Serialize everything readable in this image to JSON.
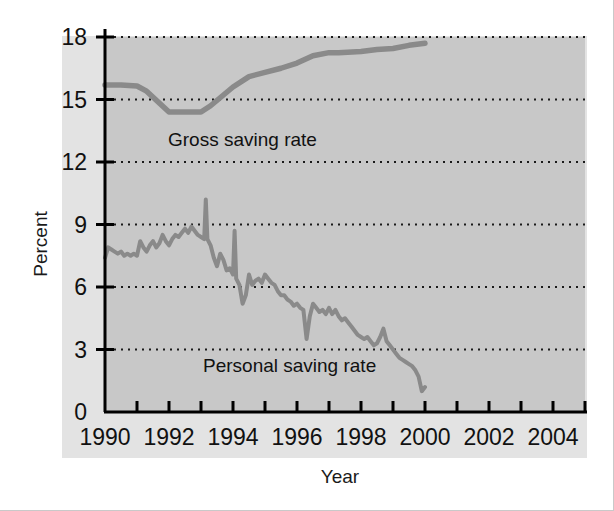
{
  "figure": {
    "background_color": "#ffffff",
    "plot_background_color": "#c8c8c8",
    "band_background_color": "#e3e3e3",
    "line_color": "#8a8a8a",
    "axis_color": "#000000",
    "grid_color": "#1a1a1a"
  },
  "axes": {
    "ylabel": "Percent",
    "xlabel": "Year",
    "y_ticks": [
      "18",
      "15",
      "12",
      "9",
      "6",
      "3",
      "0"
    ],
    "x_ticks": [
      "1990",
      "1992",
      "1994",
      "1996",
      "1998",
      "2000",
      "2002",
      "2004"
    ]
  },
  "annotations": {
    "gross": "Gross saving rate",
    "personal": "Personal saving rate"
  },
  "chart_data": {
    "type": "line",
    "title": "",
    "xlabel": "Year",
    "ylabel": "Percent",
    "xlim": [
      1990,
      2005
    ],
    "ylim": [
      0,
      18
    ],
    "grid": true,
    "grid_style": "dotted-horizontal",
    "y_tick_values": [
      0,
      3,
      6,
      9,
      12,
      15,
      18
    ],
    "x_tick_values": [
      1990,
      1991,
      1992,
      1993,
      1994,
      1995,
      1996,
      1997,
      1998,
      1999,
      2000,
      2001,
      2002,
      2003,
      2004,
      2005
    ],
    "x_tick_labels_shown": [
      1990,
      1992,
      1994,
      1996,
      1998,
      2000,
      2002,
      2004
    ],
    "legend_position": "inline-annotation",
    "series": [
      {
        "name": "Gross saving rate",
        "color": "#8a8a8a",
        "x": [
          1990.0,
          1990.5,
          1991.0,
          1991.3,
          1992.0,
          1992.5,
          1993.0,
          1993.3,
          1994.0,
          1994.5,
          1995.0,
          1995.5,
          1996.0,
          1996.5,
          1997.0,
          1997.3,
          1998.0,
          1998.5,
          1999.0,
          1999.5,
          2000.0
        ],
        "values": [
          15.7,
          15.7,
          15.65,
          15.4,
          14.4,
          14.4,
          14.4,
          14.7,
          15.6,
          16.1,
          16.3,
          16.5,
          16.75,
          17.1,
          17.25,
          17.25,
          17.3,
          17.4,
          17.45,
          17.6,
          17.7
        ]
      },
      {
        "name": "Personal saving rate",
        "color": "#8a8a8a",
        "x": [
          1990.0,
          1990.1,
          1990.2,
          1990.3,
          1990.4,
          1990.5,
          1990.6,
          1990.7,
          1990.8,
          1990.9,
          1991.0,
          1991.1,
          1991.2,
          1991.3,
          1991.4,
          1991.5,
          1991.6,
          1991.7,
          1991.8,
          1991.9,
          1992.0,
          1992.1,
          1992.2,
          1992.3,
          1992.4,
          1992.5,
          1992.6,
          1992.7,
          1992.8,
          1992.9,
          1993.0,
          1993.1,
          1993.15,
          1993.2,
          1993.3,
          1993.4,
          1993.5,
          1993.6,
          1993.7,
          1993.8,
          1993.9,
          1994.0,
          1994.05,
          1994.1,
          1994.2,
          1994.3,
          1994.4,
          1994.5,
          1994.6,
          1994.7,
          1994.8,
          1994.9,
          1995.0,
          1995.1,
          1995.2,
          1995.3,
          1995.4,
          1995.5,
          1995.6,
          1995.7,
          1995.8,
          1995.9,
          1996.0,
          1996.1,
          1996.2,
          1996.3,
          1996.4,
          1996.5,
          1996.6,
          1996.7,
          1996.8,
          1996.9,
          1997.0,
          1997.1,
          1997.2,
          1997.3,
          1997.4,
          1997.5,
          1997.6,
          1997.7,
          1997.8,
          1997.9,
          1998.0,
          1998.1,
          1998.2,
          1998.3,
          1998.4,
          1998.5,
          1998.6,
          1998.7,
          1998.8,
          1998.9,
          1999.0,
          1999.1,
          1999.2,
          1999.3,
          1999.4,
          1999.5,
          1999.6,
          1999.7,
          1999.8,
          1999.9,
          2000.0
        ],
        "values": [
          7.4,
          7.9,
          7.8,
          7.7,
          7.6,
          7.7,
          7.5,
          7.6,
          7.5,
          7.6,
          7.5,
          8.2,
          7.9,
          7.7,
          8.0,
          8.2,
          7.9,
          8.1,
          8.5,
          8.2,
          8.0,
          8.3,
          8.5,
          8.4,
          8.6,
          8.8,
          8.6,
          8.9,
          8.7,
          8.5,
          8.4,
          8.3,
          10.2,
          8.3,
          8.0,
          7.4,
          7.0,
          7.6,
          7.3,
          6.8,
          6.9,
          6.6,
          8.7,
          6.4,
          6.1,
          5.2,
          5.6,
          6.6,
          6.1,
          6.3,
          6.4,
          6.2,
          6.6,
          6.4,
          6.2,
          6.1,
          5.8,
          5.6,
          5.6,
          5.4,
          5.3,
          5.1,
          5.2,
          5.0,
          4.9,
          3.5,
          4.6,
          5.2,
          5.0,
          4.8,
          4.9,
          4.7,
          5.0,
          4.7,
          4.9,
          4.6,
          4.4,
          4.5,
          4.3,
          4.1,
          3.9,
          3.7,
          3.6,
          3.5,
          3.6,
          3.4,
          3.2,
          3.3,
          3.6,
          4.0,
          3.4,
          3.2,
          3.0,
          2.8,
          2.6,
          2.5,
          2.4,
          2.3,
          2.2,
          2.0,
          1.7,
          1.0,
          1.2
        ]
      }
    ]
  }
}
